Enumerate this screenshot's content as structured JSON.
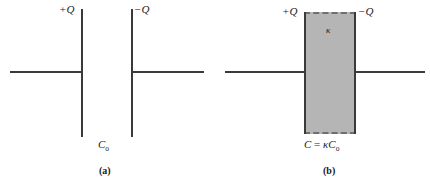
{
  "figure": {
    "type": "physics-diagram",
    "background_color": "#ffffff",
    "line_color": "#3a3a3a",
    "dielectric_fill_color": "#b5b5b5",
    "dielectric_border_color": "#6f6f6f"
  },
  "panel_a": {
    "caption": "(a)",
    "positive_plate_label": "+Q",
    "negative_plate_label": "−Q",
    "capacitance_label_main": "C",
    "capacitance_label_sub": "o",
    "elements": {
      "left_plate": "positive-plate",
      "right_plate": "negative-plate",
      "left_wire": "left-lead-wire",
      "right_wire": "right-lead-wire"
    }
  },
  "panel_b": {
    "caption": "(b)",
    "positive_plate_label": "+Q",
    "negative_plate_label": "−Q",
    "dielectric_symbol": "κ",
    "capacitance_formula_lhs": "C",
    "capacitance_formula_op": " = ",
    "capacitance_formula_rhs": "κC",
    "capacitance_formula_sub": "o",
    "elements": {
      "left_plate": "positive-plate",
      "right_plate": "negative-plate",
      "left_wire": "left-lead-wire",
      "right_wire": "right-lead-wire",
      "slab": "dielectric-slab"
    }
  }
}
